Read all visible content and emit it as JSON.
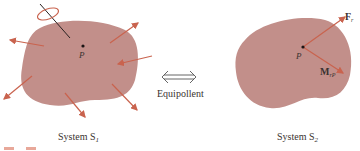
{
  "colors": {
    "body_fill": "#c28f8a",
    "arrow": "#c9634e",
    "text": "#3a3230",
    "point": "#1a1414"
  },
  "system1": {
    "label": "System S",
    "label_sub": "1",
    "point_label": "P",
    "force_arrow_count": 7,
    "has_couple": true
  },
  "middle": {
    "arrow_glyph": "⟺",
    "label": "Equipollent"
  },
  "system2": {
    "label": "System S",
    "label_sub": "2",
    "point_label": "P",
    "force_label": "F",
    "force_sub": "r",
    "moment_label": "M",
    "moment_sub": "rP"
  }
}
